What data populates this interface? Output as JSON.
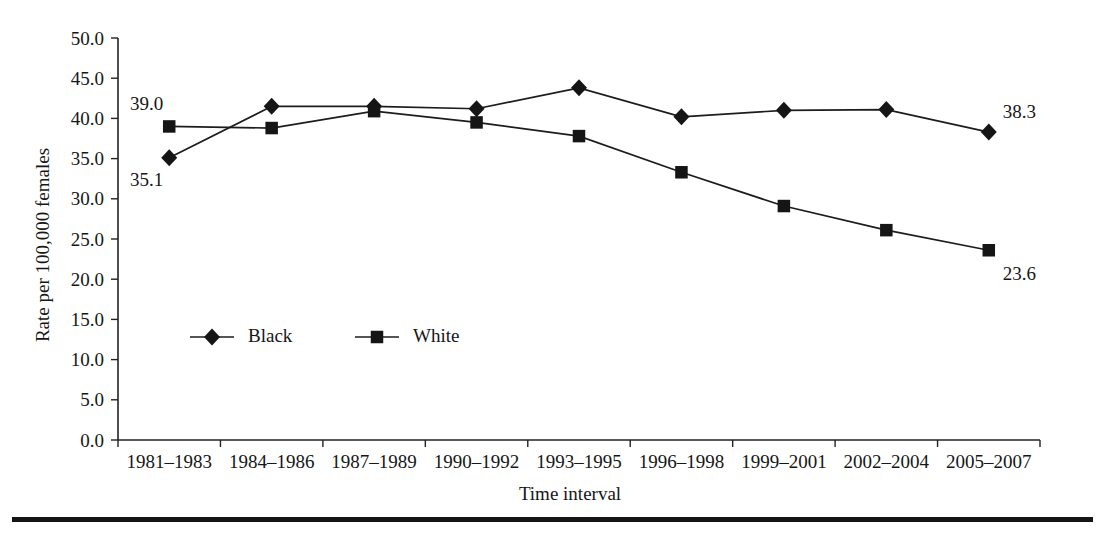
{
  "chart_data": {
    "type": "line",
    "title": "",
    "xlabel": "Time interval",
    "ylabel": "Rate per 100,000 females",
    "ylim": [
      0.0,
      50.0
    ],
    "ytick_labels": [
      "0.0",
      "5.0",
      "10.0",
      "15.0",
      "20.0",
      "25.0",
      "30.0",
      "35.0",
      "40.0",
      "45.0",
      "50.0"
    ],
    "ytick_values": [
      0.0,
      5.0,
      10.0,
      15.0,
      20.0,
      25.0,
      30.0,
      35.0,
      40.0,
      45.0,
      50.0
    ],
    "grid": false,
    "legend_position": "inside-lower-left",
    "categories": [
      "1981–1983",
      "1984–1986",
      "1987–1989",
      "1990–1992",
      "1993–1995",
      "1996–1998",
      "1999–2001",
      "2002–2004",
      "2005–2007"
    ],
    "series": [
      {
        "name": "Black",
        "marker": "diamond",
        "values": [
          35.1,
          41.5,
          41.5,
          41.2,
          43.8,
          40.2,
          41.0,
          41.1,
          38.3
        ]
      },
      {
        "name": "White",
        "marker": "square",
        "values": [
          39.0,
          38.8,
          40.9,
          39.5,
          37.8,
          33.3,
          29.1,
          26.1,
          23.6
        ]
      }
    ],
    "annotations": [
      {
        "text": "39.0",
        "series": "White",
        "category": "1981–1983",
        "value": 39.0
      },
      {
        "text": "35.1",
        "series": "Black",
        "category": "1981–1983",
        "value": 35.1
      },
      {
        "text": "38.3",
        "series": "Black",
        "category": "2005–2007",
        "value": 38.3
      },
      {
        "text": "23.6",
        "series": "White",
        "category": "2005–2007",
        "value": 23.6
      }
    ]
  },
  "legend": {
    "entries": [
      {
        "label": "Black",
        "marker": "diamond"
      },
      {
        "label": "White",
        "marker": "square"
      }
    ]
  },
  "colors": {
    "series": "#1c1c1c",
    "axis": "#222222",
    "text": "#161616",
    "background": "#ffffff",
    "rule": "#151515"
  }
}
